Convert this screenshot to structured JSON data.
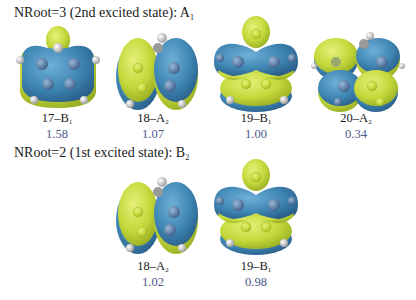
{
  "figure": {
    "colors": {
      "positive_lobe": "#c8dc3a",
      "negative_lobe": "#3f86b4",
      "atom_c": "#5a7fa8",
      "atom_h": "#e8e8e8",
      "value_text": "#4a5a8c"
    },
    "sections": [
      {
        "heading": {
          "prefix": "NRoot=3 (2nd excited state): A",
          "subscript": "1"
        },
        "orbitals": [
          {
            "label": "17–B",
            "sub": "1",
            "value": "1.58"
          },
          {
            "label": "18–A",
            "sub": "2",
            "value": "1.07"
          },
          {
            "label": "19–B",
            "sub": "1",
            "value": "1.00"
          },
          {
            "label": "20–A",
            "sub": "2",
            "value": "0.34"
          }
        ]
      },
      {
        "heading": {
          "prefix": "NRoot=2 (1st excited state): B",
          "subscript": "2"
        },
        "orbitals": [
          {
            "label": "18–A",
            "sub": "2",
            "value": "1.02"
          },
          {
            "label": "19–B",
            "sub": "1",
            "value": "0.98"
          }
        ]
      }
    ]
  }
}
